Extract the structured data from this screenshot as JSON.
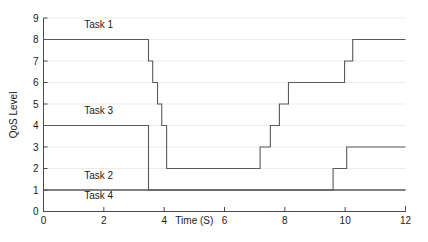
{
  "chart_data": {
    "type": "line",
    "title": "",
    "xlabel": "Time (S)",
    "ylabel": "QoS Level",
    "xlim": [
      0,
      12
    ],
    "ylim": [
      0,
      9
    ],
    "xticks": [
      0,
      2,
      4,
      6,
      8,
      10,
      12
    ],
    "yticks": [
      0,
      1,
      2,
      3,
      4,
      5,
      6,
      7,
      8,
      9
    ],
    "xtick_labels": [
      "0",
      "2",
      "4",
      "6",
      "8",
      "10",
      "12"
    ],
    "ytick_labels": [
      "0",
      "1",
      "2",
      "3",
      "4",
      "5",
      "6",
      "7",
      "8",
      "9"
    ],
    "grid": true,
    "grid_axis": "y",
    "legend_position": "inline-annotations",
    "step_style": "post",
    "line_color": "#5a5a5a",
    "grid_color": "#e2e2e2",
    "axis_color": "#4a4a4a",
    "series": [
      {
        "name": "Task 1",
        "label": "Task 1",
        "label_x": 1.35,
        "label_y": 8.55,
        "x": [
          0,
          3.48,
          3.62,
          3.78,
          3.92,
          4.08,
          7.18,
          7.52,
          7.82,
          8.12,
          9.98,
          10.25,
          12
        ],
        "y": [
          8,
          7,
          6,
          5,
          4,
          2,
          3,
          4,
          5,
          6,
          7,
          8,
          8
        ],
        "values": [
          8,
          7,
          6,
          5,
          4,
          2,
          3,
          4,
          5,
          6,
          7,
          8,
          8
        ]
      },
      {
        "name": "Task 3",
        "label": "Task 3",
        "label_x": 1.35,
        "label_y": 4.55,
        "x": [
          0,
          3.48,
          12
        ],
        "y": [
          4,
          1,
          1
        ],
        "values": [
          4,
          1,
          1
        ]
      },
      {
        "name": "Task 2",
        "label": "Task 2",
        "label_x": 1.35,
        "label_y": 1.52,
        "x": [
          0,
          9.6,
          10.05,
          12
        ],
        "y": [
          1,
          2,
          3,
          3
        ],
        "values": [
          1,
          2,
          3,
          3
        ]
      },
      {
        "name": "Task 4",
        "label": "Task 4",
        "label_x": 1.35,
        "label_y": 0.6,
        "x": [
          0,
          12
        ],
        "y": [
          1,
          1
        ],
        "values": [
          1,
          1
        ]
      }
    ]
  },
  "axes": {
    "ylabel": "QoS Level",
    "xlabel": "Time (S)"
  },
  "labels": {
    "task1": "Task 1",
    "task2": "Task 2",
    "task3": "Task 3",
    "task4": "Task 4"
  }
}
